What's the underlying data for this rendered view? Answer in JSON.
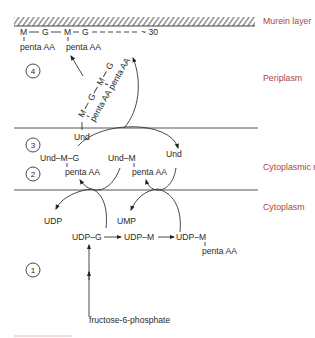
{
  "regions": {
    "murein": "Murein layer",
    "periplasm": "Periplasm",
    "membrane": "Cytoplasmic membrane",
    "cytoplasm": "Cytoplasm"
  },
  "steps": [
    "1",
    "2",
    "3",
    "4"
  ],
  "murein_chain": {
    "m1": "M",
    "g1": "G",
    "m2": "M",
    "g2": "G",
    "tail": "~ 30",
    "penta1": "penta AA",
    "penta2": "penta AA"
  },
  "periplasm_chain": {
    "m1": "M",
    "g1": "G",
    "m2": "M",
    "g2": "G",
    "penta1": "penta AA",
    "penta2": "penta AA",
    "und": "Und"
  },
  "membrane": {
    "und_m_g": "Und–M–G",
    "und_m_g_penta": "penta AA",
    "und_m": "Und–M",
    "und_m_penta": "penta AA",
    "und": "Und"
  },
  "cytoplasm": {
    "udp": "UDP",
    "ump": "UMP",
    "udp_g": "UDP–G",
    "udp_m": "UDP–M",
    "udp_m_penta": "UDP–M",
    "udp_m_penta_sub": "penta AA",
    "fructose": "fructose-6-phosphate"
  },
  "colors": {
    "label": "#b0443a",
    "ink": "#2a2a2a",
    "footer_rule": "#f2b8b0"
  }
}
